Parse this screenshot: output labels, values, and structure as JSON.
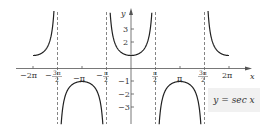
{
  "chart_data": {
    "type": "line",
    "title": "",
    "function": "y = sec x",
    "xlabel": "x",
    "ylabel": "y",
    "xlim": [
      -6.6,
      7.5
    ],
    "ylim": [
      -4.2,
      4.9
    ],
    "x_ticks": [
      "-2π",
      "-3π/2",
      "-π",
      "-π/2",
      "π/2",
      "π",
      "3π/2",
      "2π"
    ],
    "x_tick_values": [
      -6.2832,
      -4.7124,
      -3.1416,
      -1.5708,
      1.5708,
      3.1416,
      4.7124,
      6.2832
    ],
    "y_ticks": [
      "-3",
      "-2",
      "-1",
      "2",
      "3"
    ],
    "y_tick_values": [
      -3,
      -2,
      -1,
      2,
      3
    ],
    "asymptotes": [
      "-3π/2",
      "-π/2",
      "π/2",
      "3π/2"
    ],
    "asymptote_style": "dashed",
    "grid": false,
    "legend": "y = sec x",
    "legend_position": "lower right",
    "series": [
      {
        "name": "y = sec x",
        "x_range": "[-2π, 2π]",
        "sample_points": [
          {
            "x": -6.2832,
            "y": 1
          },
          {
            "x": -3.1416,
            "y": -1
          },
          {
            "x": 0,
            "y": 1
          },
          {
            "x": 3.1416,
            "y": -1
          },
          {
            "x": 6.2832,
            "y": 1
          }
        ]
      }
    ]
  },
  "labels": {
    "x_axis": "x",
    "y_axis": "y",
    "legend": "y = sec x",
    "ticks_x": {
      "m2pi": "−2π",
      "m3pi2_num": "3π",
      "m3pi2_den": "2",
      "mpi": "−π",
      "mpi2_num": "π",
      "mpi2_den": "2",
      "pi2_num": "π",
      "pi2_den": "2",
      "pi": "π",
      "p3pi2_num": "3π",
      "p3pi2_den": "2",
      "p2pi": "2π",
      "minus": "−"
    },
    "ticks_y": {
      "p3": "3",
      "p2": "2",
      "m1": "−1",
      "m2": "−2",
      "m3": "−3"
    }
  }
}
